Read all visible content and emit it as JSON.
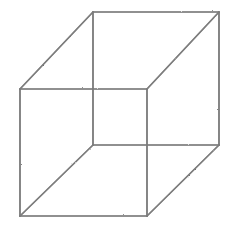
{
  "figure": {
    "name": "Necker cube",
    "type": "line-drawing",
    "canvas": {
      "width": 234,
      "height": 232,
      "background": "#ffffff"
    },
    "stroke": {
      "color": "#6e6e6e",
      "color_light": "#8d8d8d",
      "width": 1.7,
      "texture": "pencil"
    },
    "vertices": {
      "front_top_left": [
        20,
        89
      ],
      "front_top_right": [
        147,
        89
      ],
      "front_bottom_right": [
        147,
        216
      ],
      "front_bottom_left": [
        20,
        216
      ],
      "back_top_left": [
        93,
        12
      ],
      "back_top_right": [
        219,
        12
      ],
      "back_bottom_right": [
        219,
        145
      ],
      "back_bottom_left": [
        93,
        145
      ]
    },
    "edges": [
      {
        "name": "front-square-top",
        "from": "front_top_left",
        "to": "front_top_right"
      },
      {
        "name": "front-square-right",
        "from": "front_top_right",
        "to": "front_bottom_right"
      },
      {
        "name": "front-square-bottom",
        "from": "front_bottom_right",
        "to": "front_bottom_left"
      },
      {
        "name": "front-square-left",
        "from": "front_bottom_left",
        "to": "front_top_left"
      },
      {
        "name": "back-square-top",
        "from": "back_top_left",
        "to": "back_top_right"
      },
      {
        "name": "back-square-right",
        "from": "back_top_right",
        "to": "back_bottom_right"
      },
      {
        "name": "back-square-bottom",
        "from": "back_bottom_right",
        "to": "back_bottom_left"
      },
      {
        "name": "back-square-left",
        "from": "back_bottom_left",
        "to": "back_top_left"
      },
      {
        "name": "connector-top-left",
        "from": "front_top_left",
        "to": "back_top_left"
      },
      {
        "name": "connector-top-right",
        "from": "front_top_right",
        "to": "back_top_right"
      },
      {
        "name": "connector-bottom-right",
        "from": "front_bottom_right",
        "to": "back_bottom_right"
      },
      {
        "name": "connector-bottom-left",
        "from": "front_bottom_left",
        "to": "back_bottom_left"
      }
    ],
    "labels": [],
    "caption": ""
  }
}
